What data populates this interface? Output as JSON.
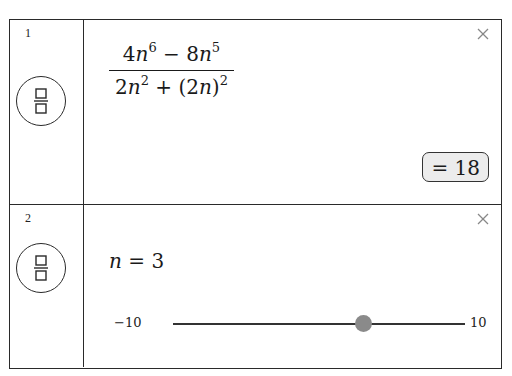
{
  "rows": [
    {
      "number": "1",
      "icon": "fraction-icon",
      "expression": {
        "numerator": {
          "t1_coef": "4",
          "t1_var": "n",
          "t1_exp": "6",
          "op": "−",
          "t2_coef": "8",
          "t2_var": "n",
          "t2_exp": "5"
        },
        "denominator": {
          "t1_coef": "2",
          "t1_var": "n",
          "t1_exp": "2",
          "op": "+",
          "t2_open": "(2",
          "t2_var": "n",
          "t2_close": ")",
          "t2_exp": "2"
        }
      },
      "result": "= 18",
      "close_icon": "close-icon"
    },
    {
      "number": "2",
      "icon": "fraction-icon",
      "assignment": {
        "var": "n",
        "eq": " = ",
        "value": "3"
      },
      "slider": {
        "min": -10,
        "max": 10,
        "value": 3,
        "min_label": "−10",
        "max_label": "10"
      },
      "close_icon": "close-icon"
    }
  ]
}
